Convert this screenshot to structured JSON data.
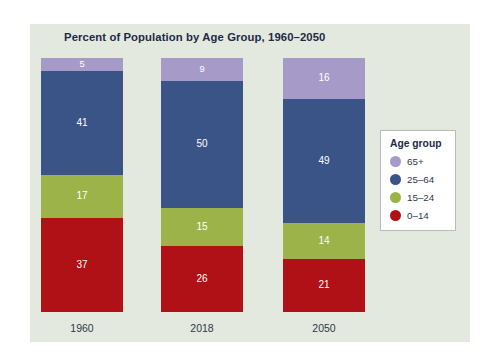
{
  "chart_data": {
    "type": "bar",
    "title": "Percent of Population by Age Group, 1960–2050",
    "subtitle": "",
    "xlabel": "",
    "ylabel": "",
    "ylim": [
      0,
      100
    ],
    "grid": false,
    "stacked": true,
    "stack_order_bottom_to_top": [
      "0–14",
      "15–24",
      "25–64",
      "65+"
    ],
    "legend": {
      "title": "Age group",
      "position": "right",
      "entries": [
        {
          "label": "65+",
          "color": "#a69ac9"
        },
        {
          "label": "25–64",
          "color": "#3a5488"
        },
        {
          "label": "15–24",
          "color": "#9bb348"
        },
        {
          "label": "0–14",
          "color": "#b01116"
        }
      ]
    },
    "categories": [
      "1960",
      "2018",
      "2050"
    ],
    "series": [
      {
        "name": "65+",
        "color": "#a69ac9",
        "values": [
          5,
          9,
          16
        ]
      },
      {
        "name": "25–64",
        "color": "#3a5488",
        "values": [
          41,
          50,
          49
        ]
      },
      {
        "name": "15–24",
        "color": "#9bb348",
        "values": [
          17,
          15,
          14
        ]
      },
      {
        "name": "0–14",
        "color": "#b01116",
        "values": [
          37,
          26,
          21
        ]
      }
    ],
    "bars": [
      {
        "category": "1960",
        "total": 100,
        "segments": [
          {
            "name": "65+",
            "value": 5,
            "label": "5",
            "color": "#a69ac9"
          },
          {
            "name": "25–64",
            "value": 41,
            "label": "41",
            "color": "#3a5488"
          },
          {
            "name": "15–24",
            "value": 17,
            "label": "17",
            "color": "#9bb348"
          },
          {
            "name": "0–14",
            "value": 37,
            "label": "37",
            "color": "#b01116"
          }
        ]
      },
      {
        "category": "2018",
        "total": 100,
        "segments": [
          {
            "name": "65+",
            "value": 9,
            "label": "9",
            "color": "#a69ac9"
          },
          {
            "name": "25–64",
            "value": 50,
            "label": "50",
            "color": "#3a5488"
          },
          {
            "name": "15–24",
            "value": 15,
            "label": "15",
            "color": "#9bb348"
          },
          {
            "name": "0–14",
            "value": 26,
            "label": "26",
            "color": "#b01116"
          }
        ]
      },
      {
        "category": "2050",
        "total": 100,
        "segments": [
          {
            "name": "65+",
            "value": 16,
            "label": "16",
            "color": "#a69ac9"
          },
          {
            "name": "25–64",
            "value": 49,
            "label": "49",
            "color": "#3a5488"
          },
          {
            "name": "15–24",
            "value": 14,
            "label": "14",
            "color": "#9bb348"
          },
          {
            "name": "0–14",
            "value": 21,
            "label": "21",
            "color": "#b01116"
          }
        ]
      }
    ]
  },
  "theme": {
    "page_background": "#ffffff",
    "panel_background": "#e4e9e0",
    "title_color": "#1d2a45",
    "tick_color": "#2d3748",
    "data_label_color": "#ffffff",
    "legend_background": "#ffffff",
    "legend_border": "#b9bdb7"
  }
}
